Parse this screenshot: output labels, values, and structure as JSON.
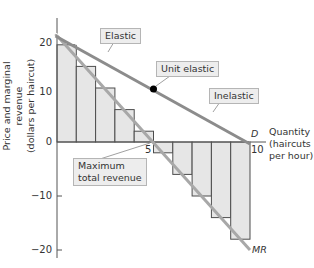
{
  "chart_data": {
    "type": "bar",
    "title": "",
    "xlabel": "Quantity (haircuts per hour)",
    "ylabel": "Price and marginal revenue (dollars per haircut)",
    "x_ticks": [
      "5",
      "10"
    ],
    "y_ticks": [
      "20",
      "10",
      "0",
      "-10",
      "-20"
    ],
    "xlim": [
      0,
      10.8
    ],
    "ylim": [
      -21,
      23
    ],
    "grid": false,
    "categories": [
      "1",
      "2",
      "3",
      "4",
      "5",
      "6",
      "7",
      "8",
      "9",
      "10"
    ],
    "series": [
      {
        "name": "Marginal revenue (bars)",
        "type": "bar",
        "values": [
          18,
          14,
          10,
          6,
          2,
          -2,
          -6,
          -10,
          -14,
          -18
        ]
      },
      {
        "name": "D",
        "type": "line",
        "x": [
          0,
          10
        ],
        "y": [
          20,
          0
        ]
      },
      {
        "name": "MR",
        "type": "line",
        "x": [
          0,
          10
        ],
        "y": [
          20,
          -20
        ]
      }
    ],
    "annotations": [
      {
        "text": "Elastic",
        "x": 2.5,
        "y": 15
      },
      {
        "text": "Unit elastic",
        "x": 5,
        "y": 10,
        "marker": "point"
      },
      {
        "text": "Inelastic",
        "x": 7.5,
        "y": 5
      },
      {
        "text": "Maximum total revenue",
        "x": 5,
        "y": 0
      }
    ],
    "colors": {
      "bar_fill": "#e6e6e6",
      "bar_stroke": "#4d4d4d",
      "demand_line": "#8c8c8c",
      "mr_line": "#a6a6a6",
      "axis": "#555555",
      "point": "#000000"
    }
  },
  "labels": {
    "y_axis_title_line1": "Price and marginal revenue",
    "y_axis_title_line2": "(dollars per haircut)",
    "x_axis_title_line1": "Quantity",
    "x_axis_title_line2": "(haircuts",
    "x_axis_title_line3": "per hour)",
    "tick_20": "20",
    "tick_10": "10",
    "tick_0": "0",
    "tick_m10": "−10",
    "tick_m20": "−20",
    "tick_x5": "5",
    "tick_x10": "10",
    "demand_label": "D",
    "mr_label": "MR",
    "elastic": "Elastic",
    "unit_elastic": "Unit elastic",
    "inelastic": "Inelastic",
    "max_revenue_line1": "Maximum",
    "max_revenue_line2": "total revenue"
  }
}
